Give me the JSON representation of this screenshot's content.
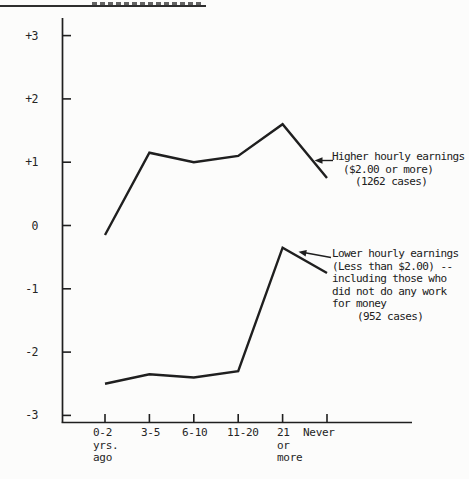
{
  "page": {
    "paper_color": "#fcfcfb",
    "ink_color": "#1f1f1f"
  },
  "chart_data": {
    "type": "line",
    "title": "",
    "xlabel": "",
    "ylabel": "",
    "categories": [
      "0-2\nyrs.\nago",
      "3-5",
      "6-10",
      "11-20",
      "21\nor\nmore",
      "Never"
    ],
    "yticks": [
      3,
      2,
      1,
      0,
      -1,
      -2,
      -3
    ],
    "ytick_labels": [
      "+3",
      "+2",
      "+1",
      "0",
      "-1",
      "-2",
      "-3"
    ],
    "ylim": [
      -3,
      3
    ],
    "grid": false,
    "legend_position": "inline-annotations",
    "series": [
      {
        "name": "Higher hourly earnings ($2.00 or more) (1262 cases)",
        "values": [
          -0.15,
          1.15,
          1.0,
          1.1,
          1.6,
          0.75
        ]
      },
      {
        "name": "Lower hourly earnings (Less than $2.00) -- including those who did not do any work for money (952 cases)",
        "values": [
          -2.5,
          -2.35,
          -2.4,
          -2.3,
          -0.35,
          -0.75
        ]
      }
    ]
  },
  "annotations": {
    "upper": {
      "lines": [
        "Higher hourly earnings",
        "($2.00 or more)",
        "(1262 cases)"
      ]
    },
    "lower": {
      "lines": [
        "Lower hourly earnings",
        "(Less than $2.00) --",
        "including those who",
        "did not do any work",
        "for money",
        "(952 cases)"
      ]
    }
  }
}
